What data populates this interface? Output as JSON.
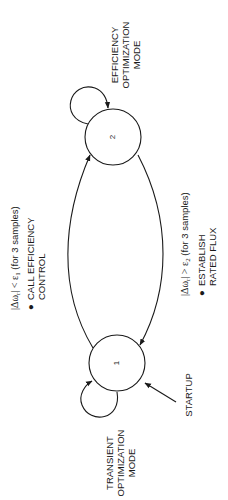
{
  "diagram": {
    "orientation": "rotated-90-ccw",
    "states": [
      {
        "id": "1",
        "label": "1",
        "name_lines": [
          "TRANSIENT",
          "OPTIMIZATION",
          "MODE"
        ]
      },
      {
        "id": "2",
        "label": "2",
        "name_lines": [
          "EFFICIENCY",
          "OPTIMIZATION",
          "MODE"
        ]
      }
    ],
    "startup": {
      "label": "STARTUP"
    },
    "transitions": {
      "to_efficiency": {
        "condition": "|Δωr| < ε1 (for 3 samples)",
        "condition_prefix": "|Δω",
        "condition_sub_r": "r",
        "condition_mid": "| < ε",
        "condition_sub_eps": "1",
        "condition_suffix": " (for 3 samples)",
        "action_bullet": "●",
        "action_lines": [
          "CALL EFFICIENCY",
          "CONTROL"
        ]
      },
      "to_transient": {
        "condition": "|Δωr| > ε2 (for 3 samples)",
        "condition_prefix": "|Δω",
        "condition_sub_r": "r",
        "condition_mid": "| > ε",
        "condition_sub_eps": "2",
        "condition_suffix": " (for 3 samples)",
        "action_bullet": "●",
        "action_lines": [
          "ESTABLISH",
          "RATED FLUX"
        ]
      }
    },
    "colors": {
      "line": "#1a1a1a",
      "background": "#ffffff"
    }
  }
}
